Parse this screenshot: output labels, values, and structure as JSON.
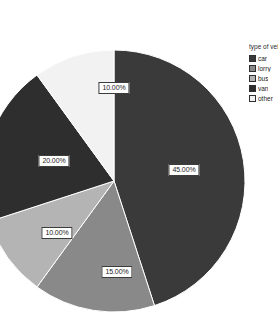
{
  "legend": {
    "title": "type of vehicl",
    "items": [
      {
        "label": "car",
        "color": "#3a3a3a"
      },
      {
        "label": "lorry",
        "color": "#898989"
      },
      {
        "label": "bus",
        "color": "#b4b4b4"
      },
      {
        "label": "van",
        "color": "#2e2e2e"
      },
      {
        "label": "other",
        "color": "#f2f2f2"
      }
    ]
  },
  "chart_data": {
    "type": "pie",
    "title": "",
    "legend_title": "type of vehicle",
    "legend_position": "right",
    "categories": [
      "car",
      "lorry",
      "bus",
      "van",
      "other"
    ],
    "values": [
      45,
      15,
      10,
      20,
      10
    ],
    "labels": [
      "45.00%",
      "15.00%",
      "10.00%",
      "20.00%",
      "10.00%"
    ],
    "colors": [
      "#3a3a3a",
      "#898989",
      "#b4b4b4",
      "#2e2e2e",
      "#f2f2f2"
    ],
    "units": "percent",
    "total": 100,
    "start_angle_deg": 0,
    "direction": "clockwise",
    "center": {
      "x": 114,
      "y": 181
    },
    "radius": 131,
    "label_positions": [
      {
        "x": 184,
        "y": 170
      },
      {
        "x": 117,
        "y": 272
      },
      {
        "x": 57,
        "y": 233
      },
      {
        "x": 54,
        "y": 161
      },
      {
        "x": 114,
        "y": 88
      }
    ]
  }
}
